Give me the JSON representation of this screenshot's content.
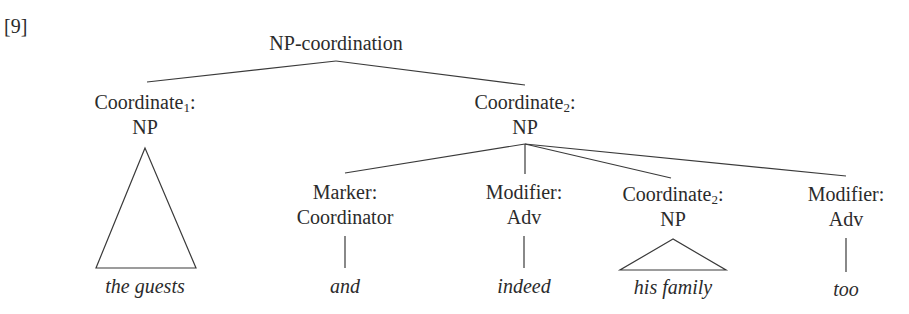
{
  "example_number": "[9]",
  "tree": {
    "root": {
      "label": "NP-coordination"
    },
    "coordinate1": {
      "function": "Coordinate",
      "subscript": "1",
      "category": "NP",
      "leaf": "the guests",
      "collapsed": true
    },
    "coordinate2": {
      "function": "Coordinate",
      "subscript": "2",
      "category": "NP",
      "children": [
        {
          "function": "Marker:",
          "category": "Coordinator",
          "leaf": "and"
        },
        {
          "function": "Modifier:",
          "category": "Adv",
          "leaf": "indeed"
        },
        {
          "function": "Coordinate",
          "subscript": "2",
          "category": "NP",
          "leaf": "his family",
          "collapsed": true
        },
        {
          "function": "Modifier:",
          "category": "Adv",
          "leaf": "too"
        }
      ]
    }
  },
  "colors": {
    "line": "#3a3a3a",
    "text": "#2b2b2b",
    "background": "#ffffff"
  }
}
